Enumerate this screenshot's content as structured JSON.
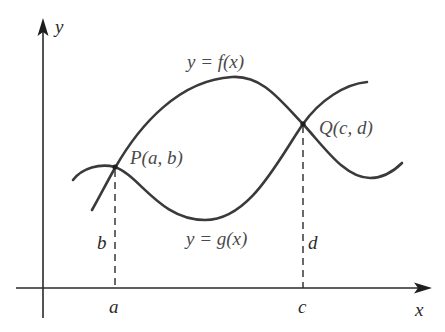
{
  "diagram": {
    "axes": {
      "x_label": "x",
      "y_label": "y"
    },
    "curves": {
      "f": {
        "label": "y = f(x)"
      },
      "g": {
        "label": "y = g(x)"
      }
    },
    "points": {
      "P": {
        "label": "P(a, b)",
        "x_tick": "a",
        "y_value": "b"
      },
      "Q": {
        "label": "Q(c, d)",
        "x_tick": "c",
        "y_value": "d"
      }
    },
    "colors": {
      "curve": "#3a3a3a",
      "axis": "#2a2a2a",
      "background": "#ffffff"
    }
  }
}
